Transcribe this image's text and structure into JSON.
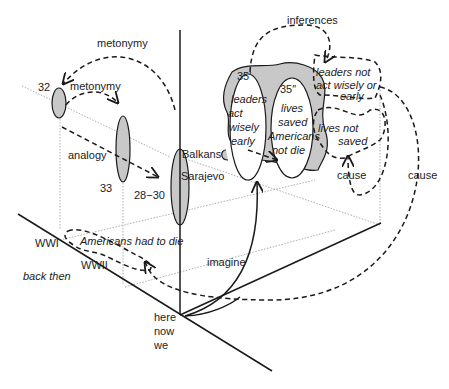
{
  "diagram": {
    "labels": {
      "metonymy_top": "metonymy",
      "metonymy_mid": "metonymy",
      "analogy": "analogy",
      "inferences": "inferences",
      "n32": "32",
      "n33": "33",
      "n28_30": "28−30",
      "n35p": "35′",
      "n35pp": "35″",
      "balkans": "Balkans",
      "sarajevo": "Sarajevo",
      "leaders_act": [
        "leaders",
        "act",
        "wisely",
        "early"
      ],
      "lives_saved": [
        "lives",
        "saved",
        "Americans",
        "not die"
      ],
      "leaders_not": [
        "leaders not",
        "act wisely or",
        "early"
      ],
      "lives_not": [
        "lives not",
        "saved"
      ],
      "cause_inner": "cause",
      "cause_outer": "cause",
      "wwi": "WWI",
      "wwii": "WWII",
      "americans_had_to_die": "Americans had to die",
      "back_then": "back then",
      "imagine": "imagine",
      "here_now_we": [
        "here",
        "now",
        "we"
      ]
    }
  }
}
